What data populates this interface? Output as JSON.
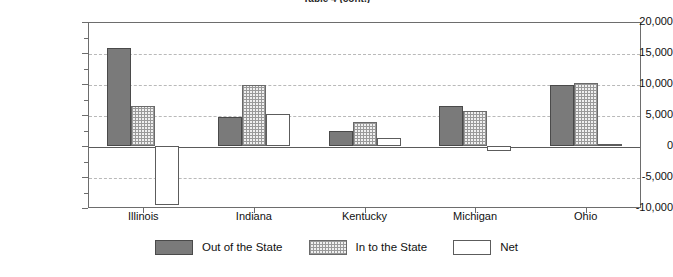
{
  "chart_data": {
    "type": "bar",
    "title": "Table 4 (cont.)",
    "xlabel": "",
    "ylabel": "",
    "ylim": [
      -10000,
      20000
    ],
    "ytick_step": 5000,
    "minor_tick_step": 2500,
    "grid": true,
    "legend_position": "bottom",
    "categories": [
      "Illinois",
      "Indiana",
      "Kentucky",
      "Michigan",
      "Ohio"
    ],
    "ytick_labels": [
      "20,000",
      "15,000",
      "10,000",
      "5,000",
      "0",
      "-5,000",
      "-10,000"
    ],
    "ytick_values": [
      20000,
      15000,
      10000,
      5000,
      0,
      -5000,
      -10000
    ],
    "series": [
      {
        "name": "Out of the State",
        "style": "solid-gray",
        "color": "#7a7a7a",
        "values": [
          15800,
          4600,
          2400,
          6400,
          9900
        ]
      },
      {
        "name": "In to the State",
        "style": "dotted-hatch",
        "color": "#d4d4d4",
        "values": [
          6400,
          9900,
          3900,
          5700,
          10100
        ]
      },
      {
        "name": "Net",
        "style": "white",
        "color": "#ffffff",
        "values": [
          -9500,
          5200,
          1300,
          -800,
          250
        ]
      }
    ]
  },
  "legend": {
    "items": [
      {
        "label": "Out of the State",
        "swatch": "solid-gray-swatch"
      },
      {
        "label": "In to the State",
        "swatch": "hatched-gray-swatch"
      },
      {
        "label": "Net",
        "swatch": "white-swatch"
      }
    ]
  }
}
